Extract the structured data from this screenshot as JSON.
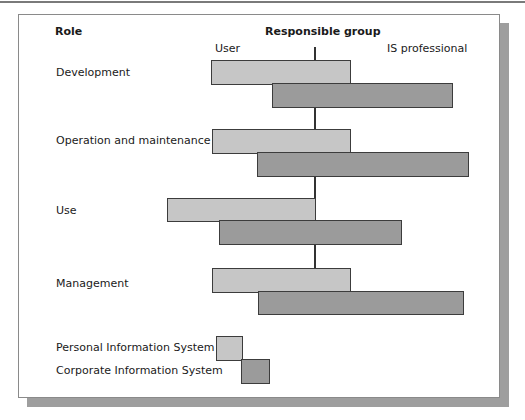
{
  "diagram": {
    "headers": {
      "role": "Role",
      "responsible_group": "Responsible group",
      "user": "User",
      "is_professional": "IS professional"
    },
    "colors": {
      "personal": "#c6c6c6",
      "corporate": "#9b9b9b",
      "border": "#3c3c3c",
      "shadow": "#9e9e9e"
    },
    "axis_x": 314,
    "axis_segments": [
      {
        "top": 47,
        "bottom": 61
      },
      {
        "top": 106,
        "bottom": 130
      },
      {
        "top": 175,
        "bottom": 199
      },
      {
        "top": 243,
        "bottom": 269
      }
    ],
    "roles": [
      {
        "label": "Development",
        "label_y": 66,
        "personal": {
          "left": 211,
          "right": 351,
          "top": 60,
          "bottom": 85
        },
        "corporate": {
          "left": 272,
          "right": 453,
          "top": 83,
          "bottom": 108
        }
      },
      {
        "label": "Operation and maintenance",
        "label_y": 134,
        "personal": {
          "left": 212,
          "right": 351,
          "top": 129,
          "bottom": 154
        },
        "corporate": {
          "left": 257,
          "right": 469,
          "top": 152,
          "bottom": 177
        }
      },
      {
        "label": "Use",
        "label_y": 204,
        "personal": {
          "left": 167,
          "right": 316,
          "top": 198,
          "bottom": 222
        },
        "corporate": {
          "left": 219,
          "right": 402,
          "top": 220,
          "bottom": 245
        }
      },
      {
        "label": "Management",
        "label_y": 277,
        "personal": {
          "left": 212,
          "right": 351,
          "top": 268,
          "bottom": 293
        },
        "corporate": {
          "left": 258,
          "right": 464,
          "top": 291,
          "bottom": 315
        }
      }
    ],
    "legend": [
      {
        "key": "personal",
        "label": "Personal Information System",
        "label_y": 341,
        "swatch": {
          "left": 216,
          "right": 243,
          "top": 336,
          "bottom": 361
        }
      },
      {
        "key": "corporate",
        "label": "Corporate Information System",
        "label_y": 364,
        "swatch": {
          "left": 241,
          "right": 270,
          "top": 359,
          "bottom": 384
        }
      }
    ]
  }
}
